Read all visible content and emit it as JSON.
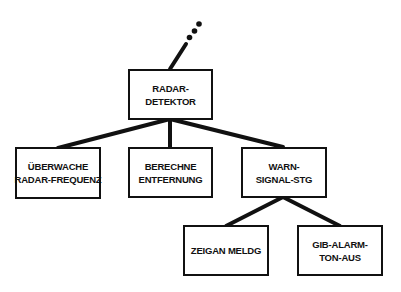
{
  "diagram": {
    "type": "hierarchy-tree",
    "colors": {
      "line": "#111111",
      "box_border": "#111111",
      "text": "#111111",
      "background": "#ffffff"
    },
    "continuation_indicator": "ellipsis-dots-above-root",
    "nodes": {
      "root": {
        "lines": [
          "RADAR-",
          "DETEKTOR"
        ]
      },
      "monitor": {
        "lines": [
          "ÜBERWACHE",
          "RADAR-FREQUENZ"
        ]
      },
      "compute": {
        "lines": [
          "BERECHNE",
          "ENTFERNUNG"
        ]
      },
      "warn": {
        "lines": [
          "WARN-",
          "SIGNAL-STG"
        ]
      },
      "display": {
        "lines": [
          "ZEIGAN MELDG"
        ]
      },
      "alarm": {
        "lines": [
          "GIB-ALARM-",
          "TON-AUS"
        ]
      }
    },
    "edges": [
      [
        "root",
        "monitor"
      ],
      [
        "root",
        "compute"
      ],
      [
        "root",
        "warn"
      ],
      [
        "warn",
        "display"
      ],
      [
        "warn",
        "alarm"
      ]
    ]
  }
}
